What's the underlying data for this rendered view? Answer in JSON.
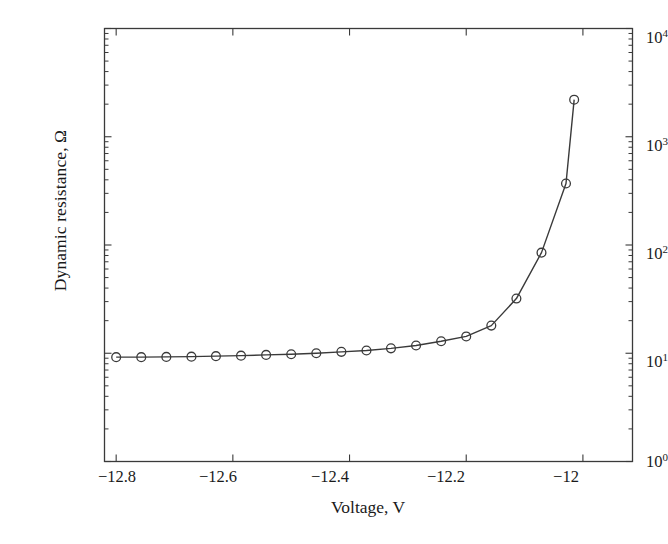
{
  "chart_data": {
    "type": "line",
    "title": "",
    "xlabel": "Voltage, V",
    "ylabel": "Dynamic resistance, Ω",
    "xscale": "linear",
    "yscale": "log",
    "xlim": [
      -12.82,
      -11.915
    ],
    "ylim": [
      1,
      10000
    ],
    "grid": false,
    "legend": null,
    "marker": "open-circle",
    "line_color": "#3a3a3a",
    "xticks": [
      -12.8,
      -12.6,
      -12.4,
      -12.2,
      -12
    ],
    "xtick_labels": [
      "−12.8",
      "−12.6",
      "−12.4",
      "−12.2",
      "−12"
    ],
    "yticks": [
      1,
      10,
      100,
      1000,
      10000
    ],
    "ytick_labels": [
      "10",
      "10",
      "10",
      "10",
      "10"
    ],
    "ytick_exponents": [
      "0",
      "1",
      "2",
      "3",
      "4"
    ],
    "x": [
      -12.8,
      -12.757,
      -12.714,
      -12.671,
      -12.629,
      -12.586,
      -12.543,
      -12.5,
      -12.457,
      -12.414,
      -12.371,
      -12.329,
      -12.286,
      -12.243,
      -12.2,
      -12.157,
      -12.114,
      -12.071,
      -12.029,
      -12.015
    ],
    "values": [
      9.2,
      9.2,
      9.25,
      9.3,
      9.4,
      9.5,
      9.65,
      9.8,
      10.0,
      10.3,
      10.6,
      11.1,
      11.8,
      12.9,
      14.3,
      18.0,
      32.0,
      85.0,
      370.0,
      2200.0
    ],
    "series": [
      {
        "name": "Dynamic resistance",
        "values": [
          9.2,
          9.2,
          9.25,
          9.3,
          9.4,
          9.5,
          9.65,
          9.8,
          10.0,
          10.3,
          10.6,
          11.1,
          11.8,
          12.9,
          14.3,
          18.0,
          32.0,
          85.0,
          370.0,
          2200.0
        ]
      }
    ],
    "n_points": 20
  },
  "axes": {
    "x_title": "Voltage, V",
    "y_title": "Dynamic resistance, Ω",
    "x_labels": [
      "−12.8",
      "−12.6",
      "−12.4",
      "−12.2",
      "−12"
    ],
    "y_mantissa": "10",
    "y_exponents": [
      "0",
      "1",
      "2",
      "3",
      "4"
    ]
  }
}
